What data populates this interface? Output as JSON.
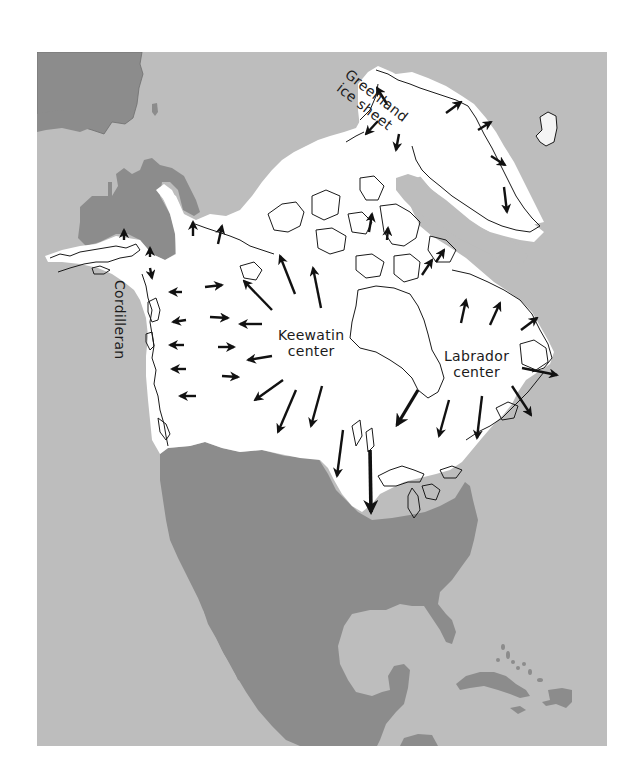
{
  "map": {
    "title": "Pleistocene ice sheets of North America",
    "colors": {
      "ocean": "#bdbdbd",
      "land": "#8c8c8c",
      "ice": "#ffffff",
      "coastline": "#1a1a1a",
      "arrow": "#111111",
      "page_background": "#ffffff"
    },
    "labels": {
      "greenland_line1": "Greenland",
      "greenland_line2": "ice sheet",
      "cordilleran": "Cordilleran",
      "keewatin_line1": "Keewatin",
      "keewatin_line2": "center",
      "labrador_line1": "Labrador",
      "labrador_line2": "center"
    },
    "icons": {
      "arrow": "ice-flow-arrow"
    }
  }
}
